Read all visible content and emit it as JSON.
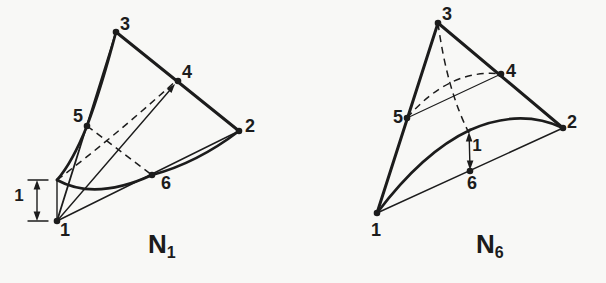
{
  "palette": {
    "background": "#f8f8f6",
    "ink": "#1c1c1c"
  },
  "figures": [
    {
      "id": "shape-function-1",
      "title_main": "N",
      "title_sub": "1",
      "nodes": {
        "n1": "1",
        "n2": "2",
        "n3": "3",
        "n4": "4",
        "n5": "5",
        "n6": "6"
      },
      "unit_dimension_label": "1"
    },
    {
      "id": "shape-function-6",
      "title_main": "N",
      "title_sub": "6",
      "nodes": {
        "n1": "1",
        "n2": "2",
        "n3": "3",
        "n4": "4",
        "n5": "5",
        "n6": "6"
      },
      "unit_dimension_label": "1"
    }
  ]
}
